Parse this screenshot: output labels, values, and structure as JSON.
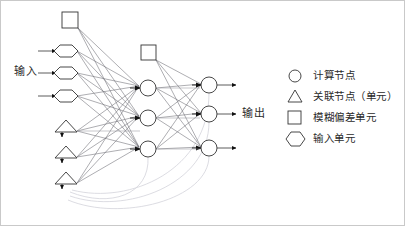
{
  "diagram": {
    "input_label": "输入",
    "output_label": "输出",
    "stroke_color": "#333333",
    "faint_color": "#cfcfd6",
    "link_color": "#555560",
    "background": "#ffffff",
    "border_color": "#c9c9c9"
  },
  "layers": {
    "input_bias": {
      "shape": "square",
      "x": 70,
      "y": 20,
      "size": 16
    },
    "input_units": [
      {
        "shape": "hexagon",
        "x": 66,
        "y": 51
      },
      {
        "shape": "hexagon",
        "x": 66,
        "y": 73
      },
      {
        "shape": "hexagon",
        "x": 66,
        "y": 96
      }
    ],
    "association_units": [
      {
        "shape": "triangle",
        "x": 66,
        "y": 131
      },
      {
        "shape": "triangle",
        "x": 66,
        "y": 157
      },
      {
        "shape": "triangle",
        "x": 66,
        "y": 183
      }
    ],
    "hidden_bias": {
      "shape": "square",
      "x": 148,
      "y": 52,
      "size": 15
    },
    "hidden_units": [
      {
        "shape": "circle",
        "x": 148,
        "y": 88
      },
      {
        "shape": "circle",
        "x": 148,
        "y": 118
      },
      {
        "shape": "circle",
        "x": 148,
        "y": 149
      }
    ],
    "output_units": [
      {
        "shape": "circle",
        "x": 209,
        "y": 85
      },
      {
        "shape": "circle",
        "x": 209,
        "y": 114
      },
      {
        "shape": "circle",
        "x": 209,
        "y": 148
      }
    ]
  },
  "legend": {
    "items": [
      {
        "symbol": "circle",
        "label": "计算节点"
      },
      {
        "symbol": "triangle",
        "label": "关联节点（单元）"
      },
      {
        "symbol": "square",
        "label": "模糊偏差单元"
      },
      {
        "symbol": "hexagon",
        "label": "输入单元"
      }
    ]
  }
}
